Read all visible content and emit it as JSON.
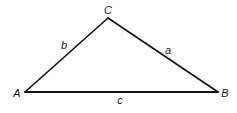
{
  "diagram": {
    "type": "triangle",
    "stroke_color": "#111111",
    "vertices": {
      "A": {
        "label": "A",
        "x": 25,
        "y": 92,
        "label_x": 17,
        "label_y": 93
      },
      "B": {
        "label": "B",
        "x": 218,
        "y": 92,
        "label_x": 225,
        "label_y": 93
      },
      "C": {
        "label": "C",
        "x": 108,
        "y": 18,
        "label_x": 108,
        "label_y": 10
      }
    },
    "sides": {
      "a": {
        "label": "a",
        "from": "B",
        "to": "C",
        "label_x": 168,
        "label_y": 50
      },
      "b": {
        "label": "b",
        "from": "A",
        "to": "C",
        "label_x": 64,
        "label_y": 45
      },
      "c": {
        "label": "c",
        "from": "A",
        "to": "B",
        "label_x": 120,
        "label_y": 100
      }
    }
  }
}
